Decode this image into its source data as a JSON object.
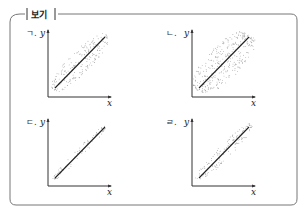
{
  "box": {
    "title": "보기"
  },
  "panels": [
    {
      "id": "a",
      "label": "ㄱ.",
      "x_label": "x",
      "y_label": "y",
      "spread": "medium"
    },
    {
      "id": "b",
      "label": "ㄴ.",
      "x_label": "x",
      "y_label": "y",
      "spread": "wide"
    },
    {
      "id": "c",
      "label": "ㄷ.",
      "x_label": "x",
      "y_label": "y",
      "spread": "narrow"
    },
    {
      "id": "d",
      "label": "ㄹ.",
      "x_label": "x",
      "y_label": "y",
      "spread": "medium-narrow"
    }
  ],
  "colors": {
    "frame": "#777777",
    "axis": "#333333",
    "line": "#222222",
    "dots": "#8a8a8a"
  }
}
